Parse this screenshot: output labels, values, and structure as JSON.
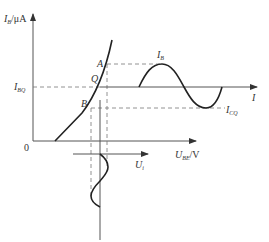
{
  "diagram": {
    "type": "transistor-input-characteristic",
    "y_axis": {
      "symbol": "I",
      "subscript": "B",
      "unit": "/μA"
    },
    "x_axis": {
      "symbol": "U",
      "subscript": "BE",
      "unit": "/V"
    },
    "origin_label": "0",
    "points": [
      {
        "label": "A"
      },
      {
        "label": "Q"
      },
      {
        "label": "B"
      }
    ],
    "ibq": {
      "symbol": "I",
      "subscript": "BQ"
    },
    "ib_wave": {
      "symbol": "I",
      "subscript": "B"
    },
    "icq": {
      "symbol": "I",
      "subscript": "CQ"
    },
    "time_axis_label": "I",
    "ui_wave": {
      "symbol": "U",
      "subscript": "i"
    },
    "colors": {
      "stroke": "#333333",
      "dashed": "#777777",
      "background": "#ffffff"
    }
  }
}
